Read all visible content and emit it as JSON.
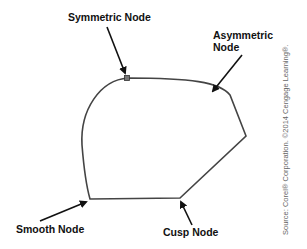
{
  "labels": {
    "symmetric": "Symmetric Node",
    "asymmetric_line1": "Asymmetric",
    "asymmetric_line2": "Node",
    "smooth": "Smooth Node",
    "cusp": "Cusp Node"
  },
  "credit": "Source: Corel® Corporation. ©2014 Cengage Learning®.",
  "colors": {
    "stroke": "#444444",
    "text": "#111111",
    "credit": "#666666"
  }
}
